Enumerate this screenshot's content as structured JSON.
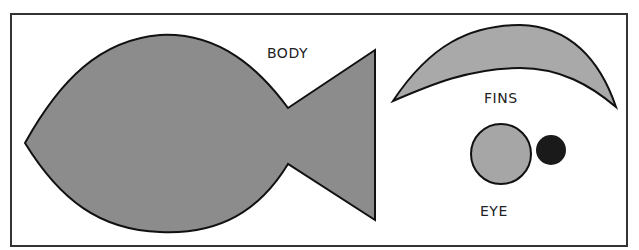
{
  "labels": {
    "body": "BODY",
    "fins": "FINS",
    "eye": "EYE"
  },
  "colors": {
    "background": "#ffffff",
    "frame": "#333333",
    "body_fill": "#8c8c8c",
    "fins_fill": "#a9a9a9",
    "eye_fill": "#a6a6a6",
    "pupil_fill": "#1a1a1a",
    "outline": "#111111"
  }
}
